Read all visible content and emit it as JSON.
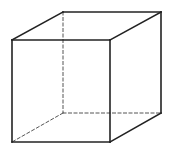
{
  "diagram": {
    "title": "",
    "type": "wireframe-cube",
    "colors": {
      "background": "#ffffff",
      "solid_edge": "#222222",
      "hidden_edge": "#555555"
    },
    "vertices": {
      "front_top_left": [
        12,
        40
      ],
      "front_top_right": [
        110,
        40
      ],
      "front_bottom_right": [
        110,
        142
      ],
      "front_bottom_left": [
        12,
        142
      ],
      "back_top_left": [
        63,
        12
      ],
      "back_top_right": [
        161,
        12
      ],
      "back_bottom_right": [
        161,
        113
      ],
      "back_bottom_left": [
        63,
        113
      ]
    },
    "visible_edges": [
      [
        "front_top_left",
        "front_top_right"
      ],
      [
        "front_top_right",
        "front_bottom_right"
      ],
      [
        "front_bottom_right",
        "front_bottom_left"
      ],
      [
        "front_bottom_left",
        "front_top_left"
      ],
      [
        "front_top_left",
        "back_top_left"
      ],
      [
        "back_top_left",
        "back_top_right"
      ],
      [
        "back_top_right",
        "front_top_right"
      ],
      [
        "back_top_right",
        "back_bottom_right"
      ],
      [
        "back_bottom_right",
        "front_bottom_right"
      ]
    ],
    "hidden_edges": [
      [
        "back_top_left",
        "back_bottom_left"
      ],
      [
        "back_bottom_left",
        "back_bottom_right"
      ],
      [
        "back_bottom_left",
        "front_bottom_left"
      ]
    ]
  }
}
